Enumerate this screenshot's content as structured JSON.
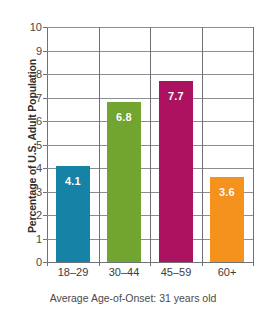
{
  "chart_data": {
    "type": "bar",
    "title": "",
    "xlabel": "",
    "ylabel": "Percentage of U.S. Adult Population",
    "categories": [
      "18–29",
      "30–44",
      "45–59",
      "60+"
    ],
    "values": [
      4.1,
      6.8,
      7.7,
      3.6
    ],
    "value_labels": [
      "4.1",
      "6.8",
      "7.7",
      "3.6"
    ],
    "bar_colors": [
      "#1682a5",
      "#72a430",
      "#ac1260",
      "#f5921e"
    ],
    "ylim": [
      0,
      10
    ],
    "yticks": [
      0,
      1,
      2,
      3,
      4,
      5,
      6,
      7,
      8,
      9,
      10
    ],
    "ytick_labels": [
      "0",
      "1",
      "2",
      "3",
      "4",
      "5",
      "6",
      "7",
      "8",
      "9",
      "10"
    ],
    "grid": true,
    "legend": false,
    "caption": "Average Age-of-Onset: 31 years old"
  },
  "colors": {
    "gridline": "#8a8d91",
    "axis": "#6e7175",
    "label_text": "#ffffff",
    "background": "#ffffff"
  }
}
